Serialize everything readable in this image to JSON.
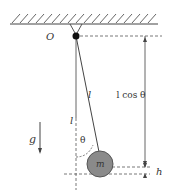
{
  "diagram": {
    "labels": {
      "pivot": "O",
      "string_length": "l",
      "vertical_length": "l",
      "height_expr": "l cos θ",
      "angle": "θ",
      "mass": "m",
      "gravity": "g",
      "rise": "h"
    },
    "colors": {
      "line": "#444444",
      "bob": "#8a8a8a",
      "bob_stroke": "#555555",
      "pivot": "#111111"
    }
  }
}
